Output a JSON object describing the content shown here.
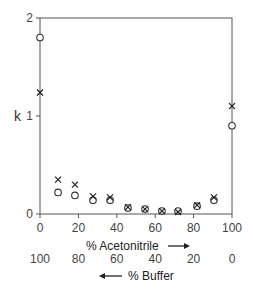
{
  "chart_data": {
    "type": "scatter",
    "title": "",
    "xlabel": "% Acetonitrile",
    "xlabel_arrow": "right",
    "x2label": "% Buffer",
    "x2label_arrow": "left",
    "ylabel": "k",
    "xlim": [
      0,
      100
    ],
    "ylim": [
      0,
      2
    ],
    "xticks": [
      0,
      20,
      40,
      60,
      80,
      100
    ],
    "xtick_labels": [
      "0",
      "20",
      "40",
      "60",
      "80",
      "100"
    ],
    "x2tick_labels": [
      "100",
      "80",
      "60",
      "40",
      "20",
      "0"
    ],
    "yticks": [
      0,
      1,
      2
    ],
    "ytick_labels": [
      "0",
      "1",
      "2"
    ],
    "grid": false,
    "legend": null,
    "series": [
      {
        "name": "circles",
        "marker": "o",
        "x": [
          0,
          9.4,
          18.2,
          27.6,
          36.5,
          45.8,
          54.7,
          63.5,
          71.9,
          81.8,
          90.6,
          100
        ],
        "y": [
          1.8,
          0.22,
          0.19,
          0.14,
          0.14,
          0.06,
          0.05,
          0.03,
          0.03,
          0.08,
          0.14,
          0.9
        ]
      },
      {
        "name": "crosses",
        "marker": "x",
        "x": [
          0,
          9.4,
          18.2,
          27.6,
          36.5,
          45.8,
          54.7,
          63.5,
          71.9,
          81.8,
          90.6,
          100
        ],
        "y": [
          1.24,
          0.35,
          0.3,
          0.18,
          0.17,
          0.07,
          0.05,
          0.03,
          0.02,
          0.09,
          0.17,
          1.1
        ]
      }
    ]
  },
  "labels": {
    "y_axis": "k",
    "x_axis_primary": "% Acetonitrile",
    "x_axis_secondary": "% Buffer"
  }
}
